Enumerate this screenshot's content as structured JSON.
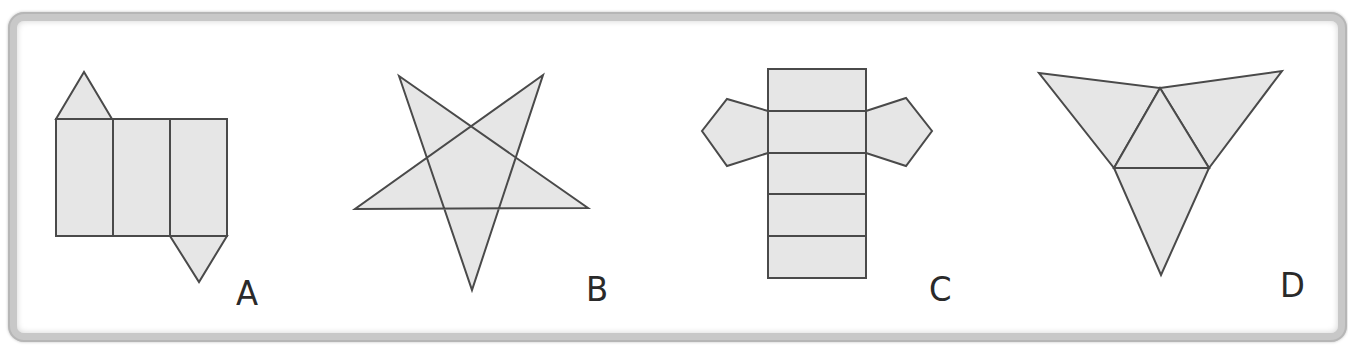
{
  "figures": [
    {
      "id": "A",
      "label": "A",
      "description": "Net of a triangular prism: three rectangles with two triangles",
      "label_pos": {
        "x": 236,
        "y": 276
      },
      "faces": [
        {
          "type": "triangle",
          "points": [
            [
              56,
              119
            ],
            [
              112,
              119
            ],
            [
              84,
              72
            ]
          ]
        },
        {
          "type": "rectangle",
          "points": [
            [
              56,
              119
            ],
            [
              113,
              119
            ],
            [
              113,
              236
            ],
            [
              56,
              236
            ]
          ]
        },
        {
          "type": "rectangle",
          "points": [
            [
              113,
              119
            ],
            [
              170,
              119
            ],
            [
              170,
              236
            ],
            [
              113,
              236
            ]
          ]
        },
        {
          "type": "rectangle",
          "points": [
            [
              170,
              119
            ],
            [
              227,
              119
            ],
            [
              227,
              236
            ],
            [
              170,
              236
            ]
          ]
        },
        {
          "type": "triangle",
          "points": [
            [
              170,
              236
            ],
            [
              227,
              236
            ],
            [
              199,
              282
            ]
          ]
        }
      ]
    },
    {
      "id": "B",
      "label": "B",
      "description": "Five-pointed star (pentagram)",
      "label_pos": {
        "x": 586,
        "y": 272
      },
      "faces": [
        {
          "type": "pentagram",
          "points": [
            [
              399,
              76
            ],
            [
              472,
              290
            ],
            [
              543,
              75
            ],
            [
              355,
              209
            ],
            [
              588,
              208
            ]
          ]
        }
      ]
    },
    {
      "id": "C",
      "label": "C",
      "description": "Net of a pentagonal prism: five stacked rectangles with two pentagons",
      "label_pos": {
        "x": 929,
        "y": 272
      },
      "faces": [
        {
          "type": "pentagon",
          "points": [
            [
              768,
              111
            ],
            [
              727,
              99
            ],
            [
              702,
              131
            ],
            [
              727,
              166
            ],
            [
              768,
              153
            ]
          ]
        },
        {
          "type": "pentagon",
          "points": [
            [
              866,
              111
            ],
            [
              906,
              98
            ],
            [
              932,
              131
            ],
            [
              906,
              166
            ],
            [
              866,
              153
            ]
          ]
        },
        {
          "type": "rectangle",
          "points": [
            [
              768,
              69
            ],
            [
              866,
              69
            ],
            [
              866,
              111
            ],
            [
              768,
              111
            ]
          ]
        },
        {
          "type": "rectangle",
          "points": [
            [
              768,
              111
            ],
            [
              866,
              111
            ],
            [
              866,
              153
            ],
            [
              768,
              153
            ]
          ]
        },
        {
          "type": "rectangle",
          "points": [
            [
              768,
              153
            ],
            [
              866,
              153
            ],
            [
              866,
              194
            ],
            [
              768,
              194
            ]
          ]
        },
        {
          "type": "rectangle",
          "points": [
            [
              768,
              194
            ],
            [
              866,
              194
            ],
            [
              866,
              236
            ],
            [
              768,
              236
            ]
          ]
        },
        {
          "type": "rectangle",
          "points": [
            [
              768,
              236
            ],
            [
              866,
              236
            ],
            [
              866,
              278
            ],
            [
              768,
              278
            ]
          ]
        }
      ]
    },
    {
      "id": "D",
      "label": "D",
      "description": "Net of a triangular pyramid (tetrahedron): four triangles",
      "label_pos": {
        "x": 1280,
        "y": 268
      },
      "faces": [
        {
          "type": "triangle",
          "points": [
            [
              1039,
              73
            ],
            [
              1160,
              88
            ],
            [
              1114,
              168
            ]
          ]
        },
        {
          "type": "triangle",
          "points": [
            [
              1160,
              88
            ],
            [
              1282,
              71
            ],
            [
              1209,
              168
            ]
          ]
        },
        {
          "type": "triangle",
          "points": [
            [
              1160,
              88
            ],
            [
              1209,
              168
            ],
            [
              1114,
              168
            ]
          ]
        },
        {
          "type": "triangle",
          "points": [
            [
              1114,
              168
            ],
            [
              1209,
              168
            ],
            [
              1161,
              275
            ]
          ]
        }
      ]
    }
  ],
  "colors": {
    "face_fill": "#e6e6e6",
    "stroke": "#4a4a4a",
    "frame_border": "#c8c8c8",
    "background": "#ffffff",
    "label": "#2a2a2a"
  }
}
